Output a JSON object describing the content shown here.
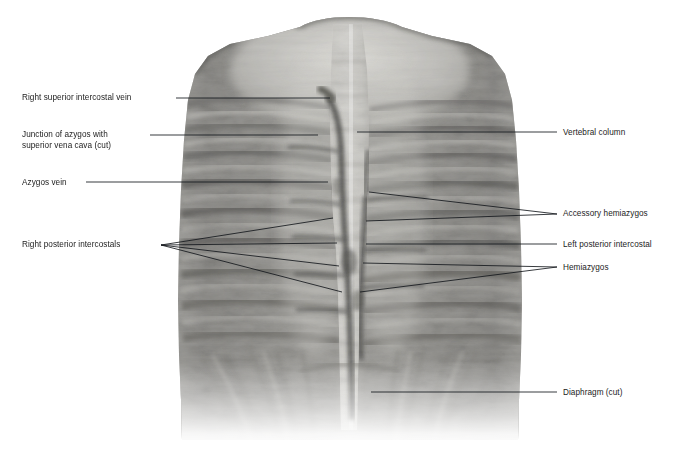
{
  "header": {
    "text": "Exhibit 149"
  },
  "figure": {
    "caption": "Posterior thoracic wall dissection, anterior view"
  },
  "labels": {
    "left": [
      {
        "id": "right-superior-intercostal-vein",
        "text": "Right superior intercostal vein",
        "x": 22,
        "y": 93
      },
      {
        "id": "junction-azygos-svc",
        "text": "Junction of azygos with\nsuperior vena cava (cut)",
        "x": 22,
        "y": 130
      },
      {
        "id": "azygos-vein",
        "text": "Azygos vein",
        "x": 22,
        "y": 178
      },
      {
        "id": "right-posterior-intercostals",
        "text": "Right posterior intercostals",
        "x": 22,
        "y": 240
      }
    ],
    "right": [
      {
        "id": "vertebral-column",
        "text": "Vertebral column",
        "x": 563,
        "y": 128
      },
      {
        "id": "accessory-hemiazygos",
        "text": "Accessory hemiazygos",
        "x": 563,
        "y": 209
      },
      {
        "id": "left-posterior-intercostal",
        "text": "Left posterior intercostal",
        "x": 563,
        "y": 240
      },
      {
        "id": "hemiazygos",
        "text": "Hemiazygos",
        "x": 563,
        "y": 263
      },
      {
        "id": "diaphragm-cut",
        "text": "Diaphragm (cut)",
        "x": 563,
        "y": 388
      }
    ]
  },
  "colors": {
    "leader_line": "#14181c",
    "label_text": "#1c1c1c",
    "header_text": "#555555",
    "background": "#ffffff",
    "specimen_mid": "#9a9a98",
    "specimen_dark": "#5d5d5c",
    "specimen_light": "#e7e6e2",
    "column_light": "#f2f1ed"
  }
}
